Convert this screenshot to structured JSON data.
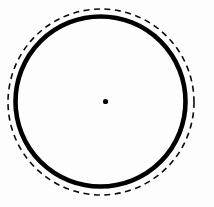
{
  "figure": {
    "type": "line-drawing",
    "canvas": {
      "width": 214,
      "height": 207,
      "background_color": "#fdfdfd"
    },
    "ink_color": "#000000",
    "elements": [
      {
        "name": "solid-circle",
        "shape": "circle",
        "style": "solid",
        "center_x": 100.5,
        "center_y": 101.5,
        "radius": 85,
        "stroke_width": 4.6,
        "stroke_color": "#000000",
        "fill": "none"
      },
      {
        "name": "dashed-circle",
        "shape": "circle",
        "style": "dashed",
        "center_x": 101,
        "center_y": 102,
        "radius": 93,
        "stroke_width": 1.6,
        "stroke_color": "#0a0a0a",
        "fill": "none",
        "dash_length": 6,
        "dash_gap": 4.5
      },
      {
        "name": "center-dot",
        "shape": "circle",
        "style": "filled",
        "center_x": 105.5,
        "center_y": 101.5,
        "radius": 2.6,
        "fill": "#000000"
      }
    ]
  }
}
